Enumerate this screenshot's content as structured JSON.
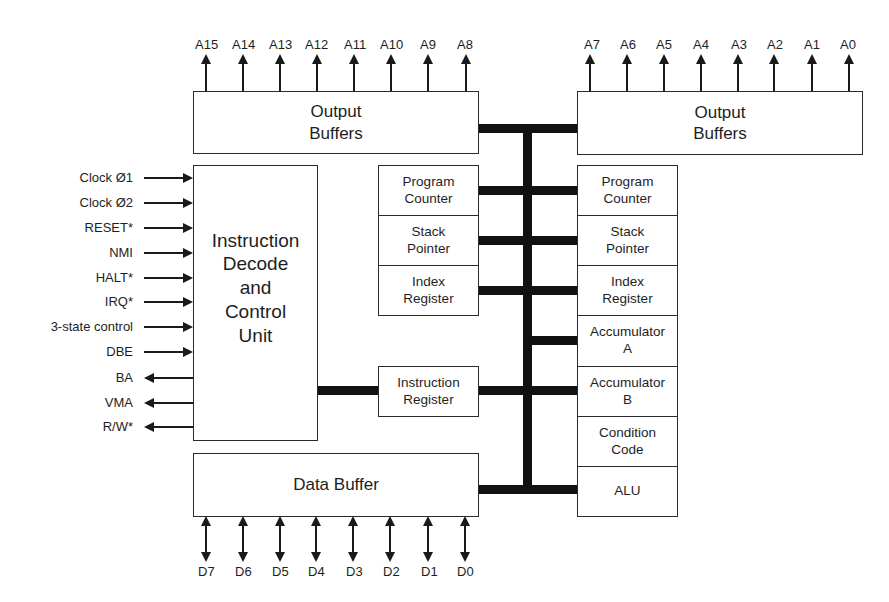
{
  "diagram": {
    "address_high_pins": [
      "A15",
      "A14",
      "A13",
      "A12",
      "A11",
      "A10",
      "A9",
      "A8"
    ],
    "address_low_pins": [
      "A7",
      "A6",
      "A5",
      "A4",
      "A3",
      "A2",
      "A1",
      "A0"
    ],
    "data_pins": [
      "D7",
      "D6",
      "D5",
      "D4",
      "D3",
      "D2",
      "D1",
      "D0"
    ],
    "output_buffers_high": "Output\nBuffers",
    "output_buffers_low": "Output\nBuffers",
    "control_unit": "Instruction\nDecode\nand\nControl\nUnit",
    "input_signals": [
      "Clock Ø1",
      "Clock Ø2",
      "RESET*",
      "NMI",
      "HALT*",
      "IRQ*",
      "3-state control",
      "DBE"
    ],
    "output_signals": [
      "BA",
      "VMA",
      "R/W*"
    ],
    "left_registers": [
      "Program\nCounter",
      "Stack\nPointer",
      "Index\nRegister"
    ],
    "instruction_register": "Instruction\nRegister",
    "right_registers": [
      "Program\nCounter",
      "Stack\nPointer",
      "Index\nRegister",
      "Accumulator\nA",
      "Accumulator\nB",
      "Condition\nCode",
      "ALU"
    ],
    "data_buffer": "Data Buffer",
    "colors": {
      "line": "#1a1a1a",
      "text": "#1e1e1e",
      "background": "#ffffff"
    }
  }
}
